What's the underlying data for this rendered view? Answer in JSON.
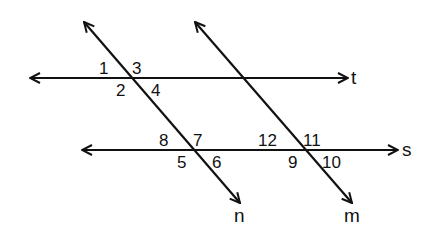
{
  "diagram": {
    "stroke_color": "#111111",
    "background": "#ffffff",
    "lines": [
      {
        "name": "t",
        "label": "t",
        "x1": 30,
        "y1": 78,
        "x2": 348,
        "y2": 78,
        "label_x": 351,
        "label_y": 84,
        "arrows": "both"
      },
      {
        "name": "s",
        "label": "s",
        "x1": 82,
        "y1": 150,
        "x2": 398,
        "y2": 150,
        "label_x": 402,
        "label_y": 156,
        "arrows": "both"
      },
      {
        "name": "n",
        "label": "n",
        "x1": 84,
        "y1": 22,
        "x2": 240,
        "y2": 203,
        "label_x": 234,
        "label_y": 222,
        "arrows": "both"
      },
      {
        "name": "m",
        "label": "m",
        "x1": 195,
        "y1": 22,
        "x2": 352,
        "y2": 203,
        "label_x": 344,
        "label_y": 222,
        "arrows": "both"
      }
    ],
    "angles": [
      {
        "label": "1",
        "x": 99,
        "y": 74
      },
      {
        "label": "3",
        "x": 132,
        "y": 74
      },
      {
        "label": "2",
        "x": 116,
        "y": 96
      },
      {
        "label": "4",
        "x": 151,
        "y": 96
      },
      {
        "label": "8",
        "x": 159,
        "y": 146
      },
      {
        "label": "7",
        "x": 193,
        "y": 146
      },
      {
        "label": "5",
        "x": 177,
        "y": 168
      },
      {
        "label": "6",
        "x": 212,
        "y": 168
      },
      {
        "label": "12",
        "x": 258,
        "y": 146
      },
      {
        "label": "11",
        "x": 303,
        "y": 146
      },
      {
        "label": "9",
        "x": 288,
        "y": 168
      },
      {
        "label": "10",
        "x": 322,
        "y": 168
      }
    ]
  }
}
